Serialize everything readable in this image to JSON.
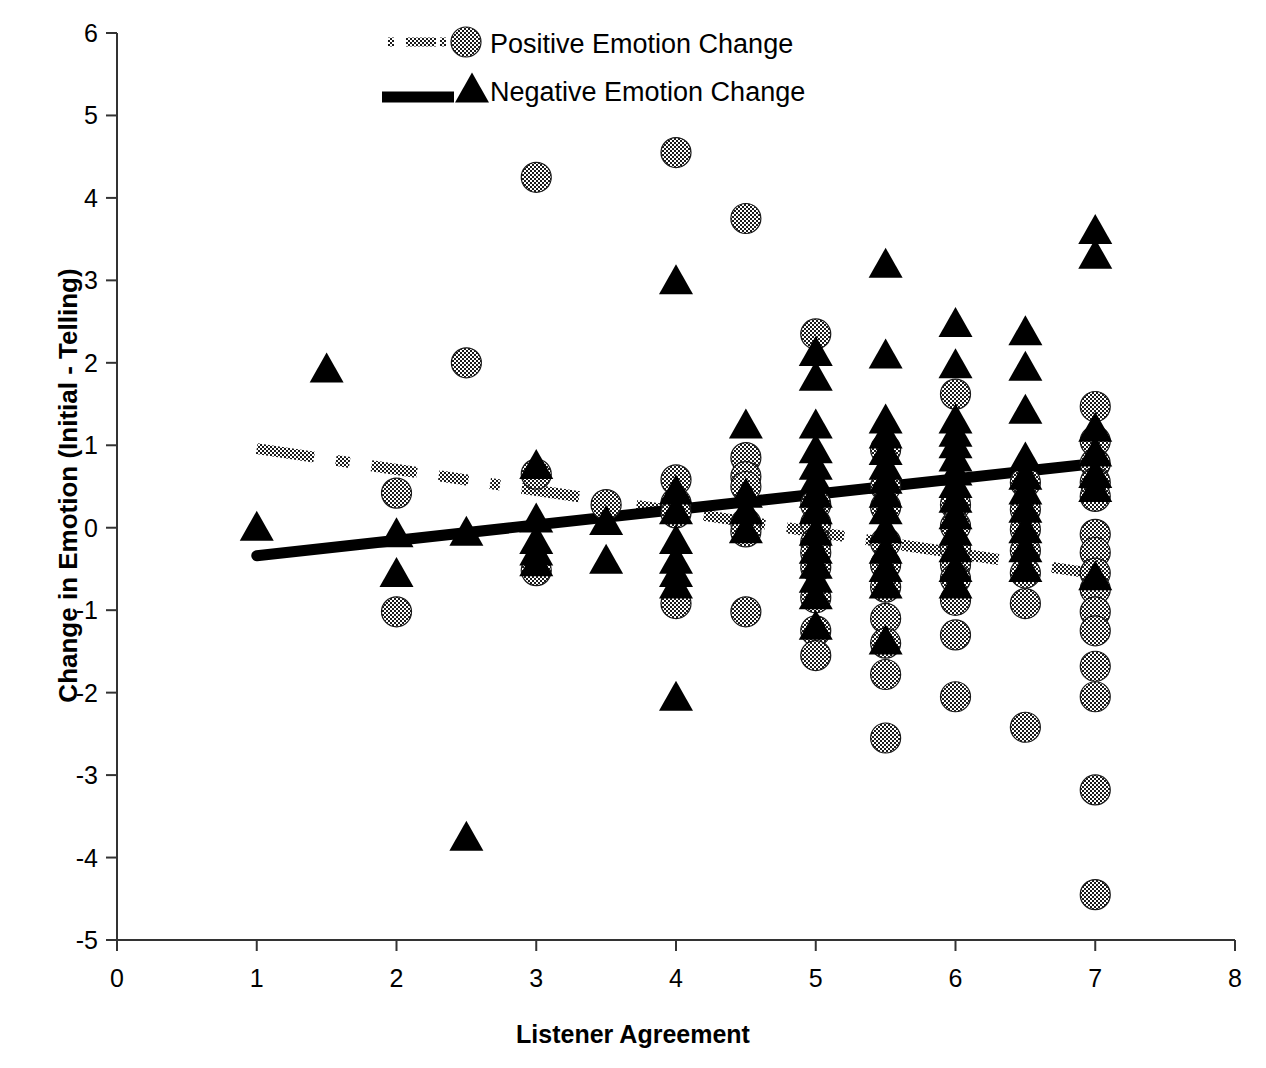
{
  "chart_data": {
    "type": "scatter",
    "title": "",
    "xlabel": "Listener Agreement",
    "ylabel": "Change in Emotion (Initial - Telling)",
    "xlim": [
      0,
      8
    ],
    "ylim": [
      -5,
      6
    ],
    "xticks": [
      "0",
      "1",
      "2",
      "3",
      "4",
      "5",
      "6",
      "7",
      "8"
    ],
    "yticks": [
      "6",
      "5",
      "4",
      "3",
      "2",
      "1",
      "0",
      "-1",
      "-2",
      "-3",
      "-4",
      "-5"
    ],
    "grid": false,
    "legend_position": "top-center",
    "legend": [
      {
        "label": "Positive Emotion Change",
        "marker": "dotted-circle",
        "line": "dotted"
      },
      {
        "label": "Negative Emotion Change",
        "marker": "solid-triangle",
        "line": "solid"
      }
    ],
    "series": [
      {
        "name": "Positive Emotion Change",
        "marker": "circle",
        "fill": "checker",
        "points": [
          [
            2,
            0.42
          ],
          [
            2,
            -1.02
          ],
          [
            2.5,
            2.0
          ],
          [
            3,
            0.65
          ],
          [
            3,
            -0.52
          ],
          [
            3.5,
            0.28
          ],
          [
            4,
            4.55
          ],
          [
            4,
            0.58
          ],
          [
            4,
            0.3
          ],
          [
            4,
            0.18
          ],
          [
            4,
            -0.92
          ],
          [
            4.5,
            3.75
          ],
          [
            4.5,
            0.85
          ],
          [
            4.5,
            0.62
          ],
          [
            4.5,
            0.5
          ],
          [
            4.5,
            0.05
          ],
          [
            4.5,
            -0.05
          ],
          [
            4.5,
            -1.02
          ],
          [
            3,
            4.25
          ],
          [
            5,
            2.35
          ],
          [
            5,
            0.28
          ],
          [
            5,
            0.05
          ],
          [
            5,
            -0.18
          ],
          [
            5,
            -0.3
          ],
          [
            5,
            -0.48
          ],
          [
            5,
            -0.85
          ],
          [
            5,
            -1.25
          ],
          [
            5,
            -1.55
          ],
          [
            5.5,
            0.95
          ],
          [
            5.5,
            0.5
          ],
          [
            5.5,
            0.25
          ],
          [
            5.5,
            -0.18
          ],
          [
            5.5,
            -0.45
          ],
          [
            5.5,
            -0.72
          ],
          [
            5.5,
            -1.1
          ],
          [
            5.5,
            -1.4
          ],
          [
            5.5,
            -1.78
          ],
          [
            5.5,
            -2.55
          ],
          [
            6,
            1.62
          ],
          [
            6,
            0.28
          ],
          [
            6,
            0.02
          ],
          [
            6,
            -0.25
          ],
          [
            6,
            -0.45
          ],
          [
            6,
            -0.62
          ],
          [
            6,
            -0.88
          ],
          [
            6,
            -1.3
          ],
          [
            6,
            -2.05
          ],
          [
            6.5,
            0.55
          ],
          [
            6.5,
            0.22
          ],
          [
            6.5,
            -0.02
          ],
          [
            6.5,
            -0.28
          ],
          [
            6.5,
            -0.55
          ],
          [
            6.5,
            -0.92
          ],
          [
            6.5,
            -2.42
          ],
          [
            7,
            1.47
          ],
          [
            7,
            1.05
          ],
          [
            7,
            0.78
          ],
          [
            7,
            0.55
          ],
          [
            7,
            0.38
          ],
          [
            7,
            -0.08
          ],
          [
            7,
            -0.3
          ],
          [
            7,
            -0.55
          ],
          [
            7,
            -0.75
          ],
          [
            7,
            -1.02
          ],
          [
            7,
            -1.25
          ],
          [
            7,
            -1.68
          ],
          [
            7,
            -2.05
          ],
          [
            7,
            -3.18
          ],
          [
            7,
            -4.45
          ]
        ]
      },
      {
        "name": "Negative Emotion Change",
        "marker": "triangle",
        "fill": "solid",
        "points": [
          [
            1,
            -0.02
          ],
          [
            1.5,
            1.9
          ],
          [
            2,
            -0.1
          ],
          [
            2,
            -0.58
          ],
          [
            2.5,
            -0.08
          ],
          [
            2.5,
            -3.78
          ],
          [
            3,
            0.73
          ],
          [
            3,
            0.08
          ],
          [
            3,
            -0.18
          ],
          [
            3,
            -0.32
          ],
          [
            3,
            -0.45
          ],
          [
            3.5,
            0.05
          ],
          [
            3.5,
            -0.42
          ],
          [
            4,
            2.97
          ],
          [
            4,
            0.42
          ],
          [
            4,
            0.18
          ],
          [
            4,
            -0.18
          ],
          [
            4,
            -0.42
          ],
          [
            4,
            -0.58
          ],
          [
            4,
            -0.72
          ],
          [
            4,
            -2.08
          ],
          [
            4.5,
            1.22
          ],
          [
            4.5,
            0.38
          ],
          [
            4.5,
            0.18
          ],
          [
            4.5,
            -0.05
          ],
          [
            5,
            2.1
          ],
          [
            5,
            1.8
          ],
          [
            5,
            1.22
          ],
          [
            5,
            0.92
          ],
          [
            5,
            0.72
          ],
          [
            5,
            0.55
          ],
          [
            5,
            0.38
          ],
          [
            5,
            0.18
          ],
          [
            5,
            -0.08
          ],
          [
            5,
            -0.3
          ],
          [
            5,
            -0.48
          ],
          [
            5,
            -0.65
          ],
          [
            5,
            -0.85
          ],
          [
            5,
            -1.22
          ],
          [
            5.5,
            3.17
          ],
          [
            5.5,
            2.07
          ],
          [
            5.5,
            1.28
          ],
          [
            5.5,
            1.1
          ],
          [
            5.5,
            0.9
          ],
          [
            5.5,
            0.72
          ],
          [
            5.5,
            0.55
          ],
          [
            5.5,
            0.38
          ],
          [
            5.5,
            0.18
          ],
          [
            5.5,
            -0.05
          ],
          [
            5.5,
            -0.3
          ],
          [
            5.5,
            -0.52
          ],
          [
            5.5,
            -0.72
          ],
          [
            5.5,
            -1.4
          ],
          [
            6,
            2.45
          ],
          [
            6,
            1.95
          ],
          [
            6,
            1.28
          ],
          [
            6,
            1.12
          ],
          [
            6,
            0.98
          ],
          [
            6,
            0.82
          ],
          [
            6,
            0.65
          ],
          [
            6,
            0.5
          ],
          [
            6,
            0.32
          ],
          [
            6,
            0.12
          ],
          [
            6,
            -0.08
          ],
          [
            6,
            -0.28
          ],
          [
            6,
            -0.52
          ],
          [
            6,
            -0.72
          ],
          [
            6.5,
            2.35
          ],
          [
            6.5,
            1.92
          ],
          [
            6.5,
            1.4
          ],
          [
            6.5,
            0.82
          ],
          [
            6.5,
            0.6
          ],
          [
            6.5,
            0.42
          ],
          [
            6.5,
            0.2
          ],
          [
            6.5,
            -0.05
          ],
          [
            6.5,
            -0.28
          ],
          [
            6.5,
            -0.52
          ],
          [
            7,
            3.58
          ],
          [
            7,
            3.28
          ],
          [
            7,
            1.18
          ],
          [
            7,
            0.88
          ],
          [
            7,
            0.62
          ],
          [
            7,
            0.45
          ],
          [
            7,
            -0.62
          ]
        ]
      }
    ],
    "trendlines": [
      {
        "name": "Positive Emotion Change",
        "style": "dotted",
        "x0": 1,
        "y0": 0.96,
        "x1": 7,
        "y1": -0.56
      },
      {
        "name": "Negative Emotion Change",
        "style": "solid",
        "x0": 1,
        "y0": -0.34,
        "x1": 7,
        "y1": 0.78
      }
    ]
  }
}
